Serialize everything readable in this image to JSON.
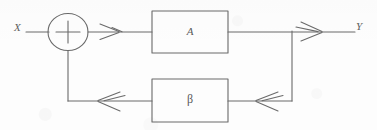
{
  "diagram": {
    "background_color": "#fdfdfd",
    "line_color": "#6a6a6a",
    "text_color": "#5a5a5a",
    "labels": {
      "input": "X",
      "output": "Y",
      "forward_block": "A",
      "feedback_block": "β"
    },
    "nodes": [
      {
        "name": "summing-junction",
        "symbol": "+",
        "shape": "circle",
        "cx": 68,
        "cy": 32,
        "r": 19
      },
      {
        "name": "forward-block",
        "label": "A",
        "shape": "rectangle",
        "x": 152,
        "y": 11,
        "width": 76,
        "height": 42
      },
      {
        "name": "feedback-block",
        "label": "β",
        "shape": "rectangle",
        "x": 152,
        "y": 79,
        "width": 76,
        "height": 43
      },
      {
        "name": "output-tap",
        "shape": "junction",
        "x": 292,
        "y": 31
      }
    ],
    "edges": [
      {
        "name": "input-to-sum",
        "from": "X",
        "to": "summing-junction",
        "direction": "right",
        "arrow": false
      },
      {
        "name": "sum-to-forward-block",
        "from": "summing-junction",
        "to": "forward-block",
        "direction": "right",
        "arrow": true
      },
      {
        "name": "forward-block-to-output",
        "from": "forward-block",
        "to": "Y",
        "direction": "right",
        "arrow": true
      },
      {
        "name": "output-tap-to-feedback-block",
        "from": "output-tap",
        "to": "feedback-block",
        "direction": "left",
        "arrow": true
      },
      {
        "name": "feedback-block-to-sum",
        "from": "feedback-block",
        "to": "summing-junction",
        "direction": "left",
        "arrow": true
      }
    ],
    "arrow_style": "open-chevron"
  }
}
